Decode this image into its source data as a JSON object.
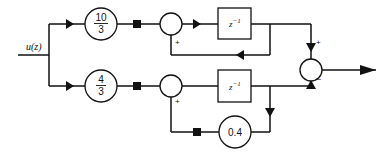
{
  "diagram": {
    "type": "block-diagram",
    "input_label": "u(z)",
    "top_branch": {
      "gain_numerator": "10",
      "gain_denominator": "3",
      "sum_sign": "+",
      "delay_label": "z",
      "delay_exponent": "−1"
    },
    "bottom_branch": {
      "gain_numerator": "4",
      "gain_denominator": "3",
      "sum_sign": "+",
      "delay_label": "z",
      "delay_exponent": "−1",
      "feedback_gain": "0.4"
    },
    "output_sum": {
      "top_sign": "+",
      "bottom_sign": "−"
    },
    "colors": {
      "line": "#111111",
      "background": "#ffffff"
    }
  }
}
